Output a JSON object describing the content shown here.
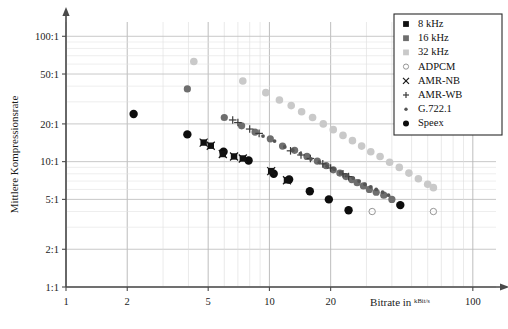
{
  "axes": {
    "y_label": "Mittlere Kompressionsrate",
    "x_label_prefix": "Bitrate in ",
    "x_label_unit_num": "kBit",
    "x_label_unit_den": "s",
    "y_ticks": [
      "1:1",
      "2:1",
      "5:1",
      "10:1",
      "20:1",
      "50:1",
      "100:1"
    ],
    "y_tick_values": [
      1,
      2,
      5,
      10,
      20,
      50,
      100
    ],
    "x_ticks": [
      "1",
      "2",
      "5",
      "10",
      "20",
      "100"
    ],
    "x_tick_values": [
      1,
      2,
      5,
      10,
      20,
      100
    ]
  },
  "legend": {
    "items": [
      {
        "label": "8 kHz",
        "marker": "square",
        "color": "#111111"
      },
      {
        "label": "16 kHz",
        "marker": "square",
        "color": "#6e6e6e"
      },
      {
        "label": "32 kHz",
        "marker": "square",
        "color": "#c9c9c9"
      },
      {
        "label": "ADPCM",
        "marker": "open-circle",
        "color": "#8a8a8a"
      },
      {
        "label": "AMR-NB",
        "marker": "cross",
        "color": "#1a1a1a"
      },
      {
        "label": "AMR-WB",
        "marker": "plus",
        "color": "#3a3a3a"
      },
      {
        "label": "G.722.1",
        "marker": "small-dot",
        "color": "#555555"
      },
      {
        "label": "Speex",
        "marker": "filled-circle",
        "color": "#0d0d0d"
      }
    ]
  },
  "chart_data": {
    "type": "scatter",
    "title": "",
    "xlabel": "Bitrate in kBit/s",
    "ylabel": "Mittlere Kompressionsrate",
    "xscale": "log",
    "yscale": "log",
    "xlim": [
      1,
      130
    ],
    "ylim": [
      1,
      130
    ],
    "grid": true,
    "legend_position": "top-right",
    "series": [
      {
        "name": "Speex",
        "marker": "filled-circle",
        "color": "#0d0d0d",
        "size": 4.2,
        "points": [
          [
            2.15,
            24.0
          ],
          [
            3.95,
            16.5
          ],
          [
            5.95,
            12.0
          ],
          [
            7.9,
            10.2
          ],
          [
            10.5,
            8.0
          ],
          [
            12.5,
            7.2
          ],
          [
            15.8,
            5.8
          ],
          [
            19.6,
            5.0
          ],
          [
            24.5,
            4.1
          ],
          [
            44.0,
            4.5
          ]
        ]
      },
      {
        "name": "AMR-NB",
        "marker": "cross",
        "color": "#1a1a1a",
        "size": 4.0,
        "points": [
          [
            4.75,
            14.2
          ],
          [
            5.15,
            13.4
          ],
          [
            5.9,
            11.5
          ],
          [
            6.7,
            11.0
          ],
          [
            7.4,
            10.6
          ],
          [
            10.2,
            8.4
          ],
          [
            12.2,
            7.1
          ]
        ]
      },
      {
        "name": "8 kHz",
        "marker": "square",
        "color": "#111111",
        "size": 3.2,
        "points": [
          [
            4.75,
            14.2
          ],
          [
            5.15,
            13.4
          ],
          [
            5.9,
            11.5
          ],
          [
            6.7,
            11.0
          ],
          [
            7.4,
            10.6
          ],
          [
            10.2,
            8.4
          ],
          [
            12.2,
            7.1
          ]
        ]
      },
      {
        "name": "16 kHz",
        "marker": "filled-circle",
        "color": "#6e6e6e",
        "size": 3.6,
        "points": [
          [
            3.95,
            38.0
          ],
          [
            6.0,
            22.5
          ],
          [
            7.3,
            19.3
          ],
          [
            8.5,
            17.2
          ],
          [
            10.1,
            15.2
          ],
          [
            11.6,
            13.3
          ],
          [
            13.3,
            12.3
          ],
          [
            15.3,
            11.0
          ],
          [
            17.2,
            10.1
          ],
          [
            19.0,
            9.3
          ],
          [
            20.6,
            8.6
          ],
          [
            22.2,
            8.1
          ],
          [
            23.8,
            7.6
          ],
          [
            25.4,
            7.2
          ],
          [
            27.0,
            6.8
          ],
          [
            29.0,
            6.4
          ],
          [
            31.0,
            6.0
          ],
          [
            33.5,
            5.7
          ],
          [
            36.5,
            5.4
          ],
          [
            40.0,
            5.0
          ]
        ]
      },
      {
        "name": "AMR-WB",
        "marker": "plus",
        "color": "#3a3a3a",
        "size": 3.8,
        "points": [
          [
            6.6,
            21.5
          ],
          [
            7.0,
            20.5
          ],
          [
            8.0,
            18.2
          ],
          [
            8.9,
            16.8
          ],
          [
            12.7,
            12.2
          ],
          [
            14.3,
            11.3
          ],
          [
            15.9,
            10.6
          ],
          [
            18.3,
            9.6
          ],
          [
            20.0,
            8.9
          ],
          [
            23.0,
            8.0
          ],
          [
            24.5,
            7.6
          ]
        ]
      },
      {
        "name": "G.722.1",
        "marker": "small-dot",
        "color": "#555555",
        "size": 1.9,
        "points": [
          [
            9.3,
            16.0
          ],
          [
            10.6,
            14.6
          ],
          [
            11.9,
            13.1
          ],
          [
            13.0,
            12.4
          ],
          [
            14.2,
            11.6
          ],
          [
            16.0,
            10.5
          ],
          [
            17.6,
            9.9
          ],
          [
            19.2,
            9.2
          ],
          [
            20.8,
            8.7
          ],
          [
            22.4,
            8.2
          ],
          [
            24.0,
            7.8
          ],
          [
            25.8,
            7.4
          ],
          [
            27.6,
            7.0
          ],
          [
            29.5,
            6.6
          ],
          [
            31.5,
            6.3
          ],
          [
            33.5,
            6.0
          ],
          [
            36.0,
            5.7
          ],
          [
            38.5,
            5.4
          ]
        ]
      },
      {
        "name": "32 kHz",
        "marker": "filled-circle",
        "color": "#c9c9c9",
        "size": 3.8,
        "points": [
          [
            4.25,
            63.0
          ],
          [
            7.4,
            44.0
          ],
          [
            9.6,
            35.5
          ],
          [
            11.2,
            31.0
          ],
          [
            12.8,
            28.0
          ],
          [
            14.4,
            25.0
          ],
          [
            16.3,
            22.5
          ],
          [
            18.4,
            20.0
          ],
          [
            20.6,
            18.0
          ],
          [
            23.0,
            16.2
          ],
          [
            25.6,
            14.7
          ],
          [
            28.4,
            13.3
          ],
          [
            31.5,
            12.0
          ],
          [
            35.0,
            11.0
          ],
          [
            39.0,
            9.9
          ],
          [
            43.5,
            9.0
          ],
          [
            48.5,
            8.1
          ],
          [
            54.0,
            7.3
          ],
          [
            60.0,
            6.6
          ],
          [
            64.0,
            6.2
          ]
        ]
      },
      {
        "name": "ADPCM",
        "marker": "open-circle",
        "color": "#8a8a8a",
        "size": 3.2,
        "points": [
          [
            32.0,
            4.0
          ],
          [
            64.0,
            4.0
          ]
        ]
      }
    ]
  }
}
